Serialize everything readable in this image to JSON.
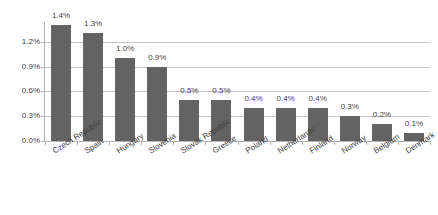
{
  "chart_data": {
    "type": "bar",
    "title": "",
    "subtitle": "",
    "xlabel": "",
    "ylabel": "",
    "categories": [
      "Czech Republic",
      "Spain",
      "Hungary",
      "Slovenia",
      "Slovak Republic",
      "Greece",
      "Poland",
      "Netherlands",
      "Finland",
      "Norway",
      "Belgium",
      "Denmark"
    ],
    "values": [
      1.4,
      1.3,
      1.0,
      0.9,
      0.5,
      0.5,
      0.4,
      0.4,
      0.4,
      0.3,
      0.2,
      0.1
    ],
    "value_labels": [
      "1.4%",
      "1.3%",
      "1.0%",
      "0.9%",
      "0.5%",
      "0.5%",
      "0.4%",
      "0.4%",
      "0.4%",
      "0.3%",
      "0.2%",
      "0.1%"
    ],
    "ylim": [
      0.0,
      1.45
    ],
    "yticks": [
      0.0,
      0.3,
      0.6,
      0.9,
      1.2
    ],
    "ytick_labels": [
      "0.0%",
      "0.3%",
      "0.6%",
      "0.9%",
      "1.2%"
    ],
    "grid": true,
    "legend": false,
    "legend_position": "none",
    "bar_color": "#636363",
    "gridline_color": "#c6c6c6",
    "axis_color": "#b5b5b5",
    "text_color": "#3f3f3f",
    "data_labels_shown": true,
    "category_label_rotation_deg": -33
  }
}
